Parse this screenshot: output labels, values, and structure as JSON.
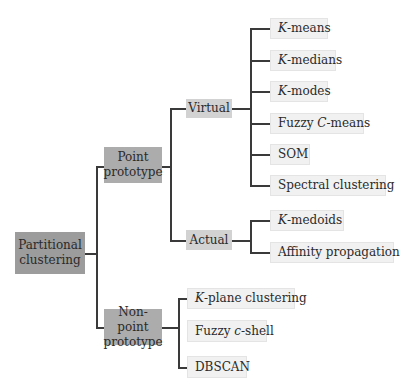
{
  "diagram": {
    "type": "taxonomy-tree",
    "root": {
      "label_line1": "Partitional",
      "label_line2": "clustering"
    },
    "branches": [
      {
        "label_line1": "Point",
        "label_line2": "prototype",
        "children": [
          {
            "label": "Virtual",
            "leaves": [
              {
                "italic": "K",
                "rest": "-means"
              },
              {
                "italic": "K",
                "rest": "-medians"
              },
              {
                "italic": "K",
                "rest": "-modes"
              },
              {
                "prefix": "Fuzzy ",
                "italic": "C",
                "rest": "-means"
              },
              {
                "rest": "SOM"
              },
              {
                "rest": "Spectral clustering"
              }
            ]
          },
          {
            "label": "Actual",
            "leaves": [
              {
                "italic": "K",
                "rest": "-medoids"
              },
              {
                "rest": "Affinity propagation"
              }
            ]
          }
        ]
      },
      {
        "label_line1": "Non-point",
        "label_line2": "prototype",
        "leaves": [
          {
            "italic": "K",
            "rest": "-plane clustering"
          },
          {
            "prefix": "Fuzzy ",
            "italic": "c",
            "rest": "-shell"
          },
          {
            "rest": "DBSCAN"
          }
        ]
      }
    ],
    "colors": {
      "root": "#9c9c9c",
      "level1": "#acacac",
      "level2": "#d2d2d2",
      "leaf": "#f1f1f1",
      "connector": "#3a3a3a"
    }
  }
}
